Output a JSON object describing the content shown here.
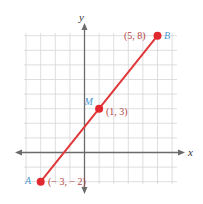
{
  "diagram": {
    "type": "coordinate-plane",
    "axes": {
      "x_label": "x",
      "y_label": "y"
    },
    "grid": {
      "x_range": [
        -4,
        6
      ],
      "y_range": [
        -2,
        8
      ],
      "step": 1
    },
    "segment": {
      "from": "A",
      "to": "B",
      "color": "#e0383a"
    },
    "points": [
      {
        "name": "A",
        "x": -3,
        "y": -2,
        "label": "(− 3, − 2)"
      },
      {
        "name": "M",
        "x": 1,
        "y": 3,
        "label": "(1, 3)"
      },
      {
        "name": "B",
        "x": 5,
        "y": 8,
        "label": "(5, 8)"
      }
    ],
    "colors": {
      "point": "#e0282e",
      "coord_label": "#b5453f",
      "point_name": "#4a9bd2",
      "grid": "#d6d6d6",
      "axis": "#6b6b6b"
    }
  }
}
